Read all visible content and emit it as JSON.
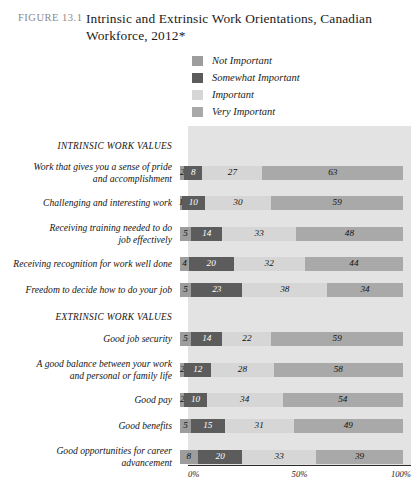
{
  "header": {
    "figure_number": "FIGURE 13.1",
    "title": "Intrinsic and Extrinsic Work Orientations, Canadian Workforce, 2012*"
  },
  "legend": {
    "items": [
      {
        "label": "Not Important",
        "color": "#9d9d9d"
      },
      {
        "label": "Somewhat Important",
        "color": "#5c5c5c"
      },
      {
        "label": "Important",
        "color": "#d6d6d6"
      },
      {
        "label": "Very Important",
        "color": "#a9a9a9"
      }
    ]
  },
  "axis": {
    "ticks": [
      "0%",
      "50%",
      "100%"
    ],
    "min": 0,
    "max": 100
  },
  "chart_data": {
    "type": "bar",
    "orientation": "horizontal",
    "stacked": true,
    "title": "Intrinsic and Extrinsic Work Orientations, Canadian Workforce, 2012*",
    "xlabel": "",
    "ylabel": "",
    "xlim": [
      0,
      100
    ],
    "grid": false,
    "legend_position": "top",
    "series": [
      {
        "name": "Not Important",
        "color": "#9d9d9d",
        "values": [
          2,
          1,
          5,
          4,
          5,
          5,
          2,
          2,
          5,
          8
        ]
      },
      {
        "name": "Somewhat Important",
        "color": "#5c5c5c",
        "values": [
          8,
          10,
          14,
          20,
          23,
          14,
          12,
          10,
          15,
          20
        ]
      },
      {
        "name": "Important",
        "color": "#d6d6d6",
        "values": [
          27,
          30,
          33,
          32,
          38,
          22,
          28,
          34,
          31,
          33
        ]
      },
      {
        "name": "Very Important",
        "color": "#a9a9a9",
        "values": [
          63,
          59,
          48,
          44,
          34,
          59,
          58,
          54,
          49,
          39
        ]
      }
    ],
    "categories": [
      "Work that gives you a sense of pride and accomplishment",
      "Challenging and interesting work",
      "Receiving training needed to do job effectively",
      "Receiving recognition for work well done",
      "Freedom to decide how to do your job",
      "Good job security",
      "A good balance between your work and personal or family life",
      "Good pay",
      "Good benefits",
      "Good opportunities for career advancement"
    ],
    "groups": [
      {
        "label": "INTRINSIC WORK VALUES",
        "start": 0,
        "count": 5
      },
      {
        "label": "EXTRINSIC WORK VALUES",
        "start": 5,
        "count": 5
      }
    ]
  },
  "rows": [
    {
      "kind": "section",
      "label": "INTRINSIC WORK VALUES"
    },
    {
      "kind": "bar",
      "label": "Work that gives you a sense of pride\nand accomplishment",
      "values": [
        2,
        8,
        27,
        63
      ]
    },
    {
      "kind": "bar",
      "label": "Challenging and interesting work",
      "values": [
        1,
        10,
        30,
        59
      ]
    },
    {
      "kind": "bar",
      "label": "Receiving training needed to do\njob effectively",
      "values": [
        5,
        14,
        33,
        48
      ]
    },
    {
      "kind": "bar",
      "label": "Receiving recognition for work well done",
      "values": [
        4,
        20,
        32,
        44
      ]
    },
    {
      "kind": "bar",
      "label": "Freedom to decide how to do your job",
      "values": [
        5,
        23,
        38,
        34
      ]
    },
    {
      "kind": "section",
      "label": "EXTRINSIC WORK VALUES"
    },
    {
      "kind": "bar",
      "label": "Good job security",
      "values": [
        5,
        14,
        22,
        59
      ]
    },
    {
      "kind": "bar",
      "label": "A good balance between your work\nand personal or family life",
      "values": [
        2,
        12,
        28,
        58
      ]
    },
    {
      "kind": "bar",
      "label": "Good pay",
      "values": [
        2,
        10,
        34,
        54
      ]
    },
    {
      "kind": "bar",
      "label": "Good benefits",
      "values": [
        5,
        15,
        31,
        49
      ]
    },
    {
      "kind": "bar",
      "label": "Good opportunities for career\nadvancement",
      "values": [
        8,
        20,
        33,
        39
      ]
    }
  ]
}
